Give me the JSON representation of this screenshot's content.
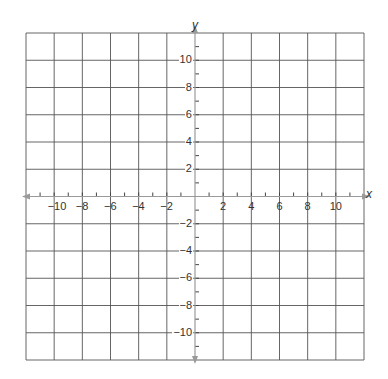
{
  "chart_data": {
    "type": "coordinate-grid",
    "title": "",
    "xlabel": "x",
    "ylabel": "y",
    "xlim": [
      -12,
      12
    ],
    "ylim": [
      -12,
      12
    ],
    "grid": true,
    "grid_step": 2,
    "minor_tick_step": 1,
    "x_tick_labels": [
      "-10",
      "-8",
      "-6",
      "-4",
      "-2",
      "2",
      "4",
      "6",
      "8",
      "10"
    ],
    "y_tick_labels": [
      "10",
      "8",
      "6",
      "4",
      "2",
      "-2",
      "-4",
      "-6",
      "-8",
      "-10"
    ],
    "x_ticks": [
      -10,
      -8,
      -6,
      -4,
      -2,
      2,
      4,
      6,
      8,
      10
    ],
    "y_ticks": [
      10,
      8,
      6,
      4,
      2,
      -2,
      -4,
      -6,
      -8,
      -10
    ],
    "series": []
  },
  "colors": {
    "grid": "#555555",
    "axis": "#9a9a9a",
    "label": "#333333"
  }
}
